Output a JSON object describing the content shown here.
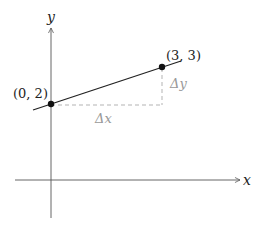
{
  "diagram": {
    "axes": {
      "x_label": "x",
      "y_label": "y"
    },
    "points": [
      {
        "label": "(0, 2)",
        "x": 0,
        "y": 2
      },
      {
        "label": "(3, 3)",
        "x": 3,
        "y": 3
      }
    ],
    "deltas": {
      "dx_label": "Δx",
      "dy_label": "Δy"
    },
    "colors": {
      "axis": "#555555",
      "line": "#222222",
      "dashed": "#aaaaaa",
      "delta_text": "#999999"
    }
  }
}
